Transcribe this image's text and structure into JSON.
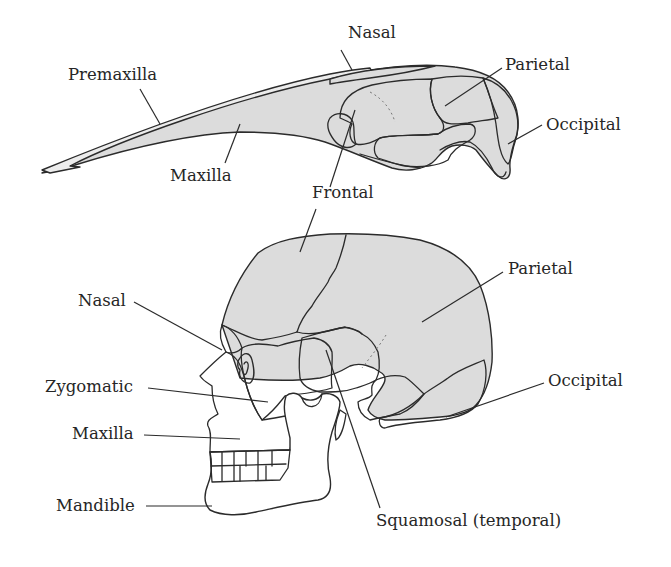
{
  "figure": {
    "type": "comparative anatomy diagram",
    "colors": {
      "bone_fill": "#dcdcdc",
      "bone_fill_dark": "#d2d2d2",
      "outline": "#2b2b2b",
      "background": "#ffffff"
    }
  },
  "bird_skull": {
    "labels": {
      "nasal": "Nasal",
      "premaxilla": "Premaxilla",
      "maxilla": "Maxilla",
      "frontal": "Frontal",
      "parietal": "Parietal",
      "occipital": "Occipital"
    }
  },
  "human_skull": {
    "labels": {
      "nasal": "Nasal",
      "zygomatic": "Zygomatic",
      "maxilla": "Maxilla",
      "mandible": "Mandible",
      "parietal": "Parietal",
      "occipital": "Occipital",
      "squamosal": "Squamosal (temporal)"
    }
  }
}
